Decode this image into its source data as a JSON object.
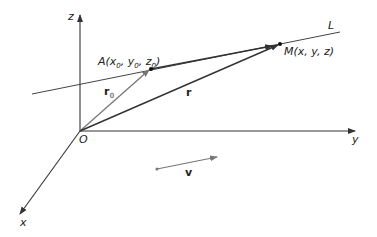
{
  "diagram": {
    "axes": {
      "z": {
        "label": "z"
      },
      "y": {
        "label": "y"
      },
      "x": {
        "label": "x"
      },
      "origin": {
        "label": "O"
      }
    },
    "line": {
      "label": "L"
    },
    "points": {
      "A": {
        "label_main": "A(x",
        "sub0": "0",
        "mid1": ", y",
        "sub1": "0",
        "mid2": ", z",
        "sub2": "0",
        "end": ")"
      },
      "M": {
        "label": "M(x, y, z)"
      }
    },
    "vectors": {
      "r0": {
        "label": "r",
        "sub": "0"
      },
      "r": {
        "label": "r"
      },
      "v": {
        "label": "v"
      }
    },
    "colors": {
      "axis": "#333333",
      "line": "#444444",
      "r0": "#777777",
      "r": "#333333",
      "v": "#777777"
    }
  }
}
